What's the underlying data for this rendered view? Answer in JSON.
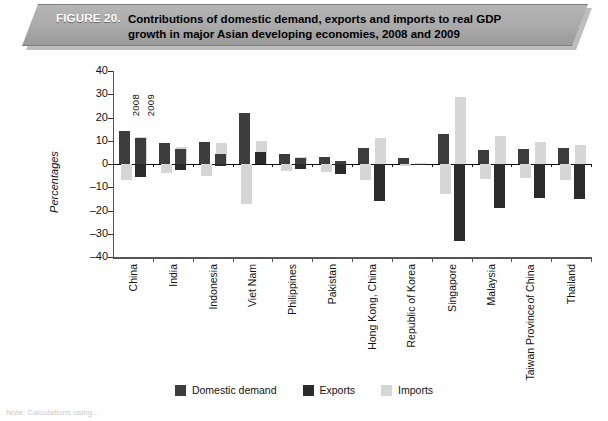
{
  "figure": {
    "label": "FIGURE 20.",
    "title_line1": "Contributions of domestic demand, exports and imports to real GDP",
    "title_line2": "growth in major Asian developing economies, 2008 and 2009"
  },
  "legend": {
    "items": [
      {
        "name": "domestic-demand",
        "label": "Domestic demand",
        "color": "#3d3d3d"
      },
      {
        "name": "exports",
        "label": "Exports",
        "color": "#2b2b2b"
      },
      {
        "name": "imports",
        "label": "Imports",
        "color": "#d6d6d6"
      }
    ]
  },
  "year_annotations": {
    "first": "2008",
    "second": "2009"
  },
  "footnote": "Note: Calculations using...",
  "chart_data": {
    "type": "bar",
    "title": "Contributions of domestic demand, exports and imports to real GDP growth in major Asian developing economies, 2008 and 2009",
    "xlabel": "",
    "ylabel": "Percentages",
    "ylim": [
      -40,
      40
    ],
    "yticks": [
      40,
      30,
      20,
      10,
      0,
      -10,
      -20,
      -30,
      -40
    ],
    "grid": false,
    "legend_position": "bottom",
    "categories": [
      "China",
      "India",
      "Indonesia",
      "Viet Nam",
      "Philippines",
      "Pakistan",
      "Hong Kong, China",
      "Republic of Korea",
      "Singapore",
      "Malaysia",
      "Taiwan Province of China",
      "Thailand"
    ],
    "years": [
      "2008",
      "2009"
    ],
    "series": [
      {
        "name": "Domestic demand",
        "color": "#3d3d3d",
        "values_2008": [
          14.0,
          9.0,
          9.5,
          22.0,
          4.5,
          3.0,
          7.0,
          2.5,
          13.0,
          6.0,
          6.5,
          7.0
        ],
        "values_2009": [
          11.0,
          6.5,
          4.5,
          5.0,
          2.5,
          1.5,
          -16.0,
          -0.5,
          -33.0,
          -2.0,
          -1.5,
          -1.0
        ]
      },
      {
        "name": "Exports",
        "color": "#2b2b2b",
        "values_2008": [
          14.0,
          9.0,
          9.5,
          22.0,
          4.5,
          3.0,
          7.0,
          2.5,
          13.0,
          6.0,
          6.5,
          7.0
        ],
        "values_2009": [
          -5.5,
          -2.5,
          -1.0,
          5.0,
          -2.0,
          -4.5,
          -16.0,
          -0.5,
          -33.0,
          -19.0,
          -14.5,
          -15.0
        ]
      },
      {
        "name": "Imports",
        "color": "#d6d6d6",
        "values_2008": [
          -7.0,
          -4.0,
          -5.0,
          -17.0,
          -3.0,
          -3.5,
          -7.0,
          -1.0,
          -13.0,
          -6.5,
          -6.0,
          -7.0
        ],
        "values_2009": [
          11.5,
          7.5,
          9.0,
          10.0,
          3.0,
          1.0,
          11.0,
          0.5,
          29.0,
          12.0,
          9.5,
          8.0
        ]
      }
    ]
  }
}
